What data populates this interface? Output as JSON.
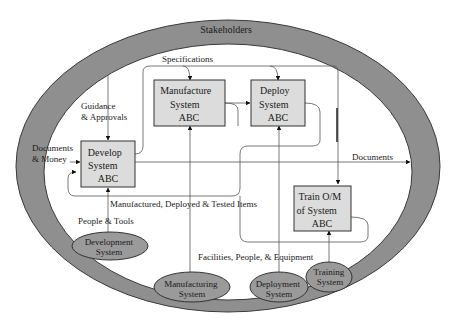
{
  "colors": {
    "ring": "#8f8f8f",
    "ring_edge": "#3a3a3a",
    "box_fill": "#dcdcdc",
    "ellipse_fill": "#9a9a9a",
    "line": "#555555",
    "text": "#1a1a1a"
  },
  "ring": {
    "label": "Stakeholders"
  },
  "processes": {
    "develop": {
      "lines": [
        "Develop",
        "System",
        "ABC"
      ]
    },
    "manufacture": {
      "lines": [
        "Manufacture",
        "System",
        "ABC"
      ]
    },
    "deploy": {
      "lines": [
        "Deploy",
        "System",
        "ABC"
      ]
    },
    "train": {
      "lines": [
        "Train O/M",
        "of System",
        "ABC"
      ]
    }
  },
  "systems": {
    "development": {
      "lines": [
        "Development",
        "System"
      ]
    },
    "manufacturing": {
      "lines": [
        "Manufacturing",
        "System"
      ]
    },
    "deployment": {
      "lines": [
        "Deployment",
        "System"
      ]
    },
    "training": {
      "lines": [
        "Training",
        "System"
      ]
    }
  },
  "flows": {
    "specifications": "Specifications",
    "guidance": [
      "Guidance",
      "& Approvals"
    ],
    "documents_money": [
      "Documents",
      "& Money"
    ],
    "documents_out": "Documents",
    "items": "Manufactured, Deployed & Tested Items",
    "people_tools": "People & Tools",
    "facilities": "Facilities, People, & Equipment"
  }
}
